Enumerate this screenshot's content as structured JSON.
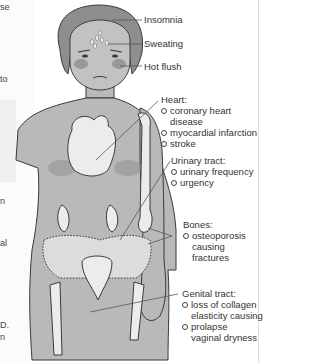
{
  "left_fragments": [
    "se",
    "to",
    "n",
    "al",
    "D.",
    "n"
  ],
  "top_labels": {
    "insomnia": "Insomnia",
    "sweating": "Sweating",
    "hot_flush": "Hot flush"
  },
  "groups": {
    "heart": {
      "title": "Heart:",
      "items": [
        "coronary heart disease",
        "myocardial infarction",
        "stroke"
      ]
    },
    "urinary": {
      "title": "Urinary tract:",
      "items": [
        "urinary frequency",
        "urgency"
      ]
    },
    "bones": {
      "title": "Bones:",
      "items": [
        "osteoporosis",
        "causing",
        "fractures"
      ]
    },
    "genital": {
      "title": "Genital tract:",
      "items": [
        "loss of collagen",
        "elasticity causing",
        "prolapse",
        "vaginal dryness"
      ]
    }
  },
  "colors": {
    "skin": "#b9b9b9",
    "organ": "#ececec",
    "outline": "#3a3a3a",
    "blush": "#8f8f8f"
  }
}
